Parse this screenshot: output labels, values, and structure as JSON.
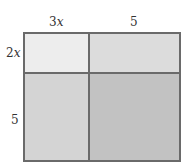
{
  "diagram": {
    "type": "area-model",
    "top_labels": [
      {
        "coef": "3",
        "var": "x"
      },
      {
        "coef": "5",
        "var": ""
      }
    ],
    "side_labels": [
      {
        "coef": "2",
        "var": "x"
      },
      {
        "coef": "5",
        "var": ""
      }
    ],
    "cells": [
      {
        "row": 0,
        "col": 0,
        "color": "#ededed"
      },
      {
        "row": 0,
        "col": 1,
        "color": "#dcdcdc"
      },
      {
        "row": 1,
        "col": 0,
        "color": "#d4d4d4"
      },
      {
        "row": 1,
        "col": 1,
        "color": "#c2c2c2"
      }
    ],
    "border_color": "#6a6a6a"
  }
}
